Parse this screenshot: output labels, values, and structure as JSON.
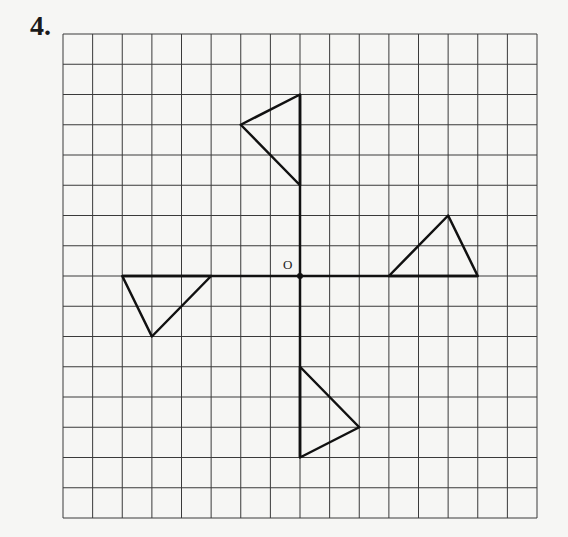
{
  "question_number": "4.",
  "origin_label": "O",
  "grid": {
    "left": 63,
    "top": 34,
    "right": 537,
    "bottom": 518,
    "cols": 16,
    "rows": 16,
    "origin_col": 8,
    "origin_row": 8,
    "line_color": "#3a3a3a"
  },
  "axes": {
    "x_range": [
      -6,
      6
    ],
    "y_range": [
      -6,
      6
    ]
  },
  "triangles": [
    {
      "name": "triangle-top",
      "points": [
        [
          0,
          6
        ],
        [
          0,
          3
        ],
        [
          -2,
          5
        ]
      ]
    },
    {
      "name": "triangle-right",
      "points": [
        [
          3,
          0
        ],
        [
          6,
          0
        ],
        [
          5,
          2
        ]
      ]
    },
    {
      "name": "triangle-bottom",
      "points": [
        [
          0,
          -3
        ],
        [
          0,
          -6
        ],
        [
          2,
          -5
        ]
      ]
    },
    {
      "name": "triangle-left",
      "points": [
        [
          -6,
          0
        ],
        [
          -3,
          0
        ],
        [
          -5,
          -2
        ]
      ]
    }
  ],
  "stroke_color": "#111111"
}
